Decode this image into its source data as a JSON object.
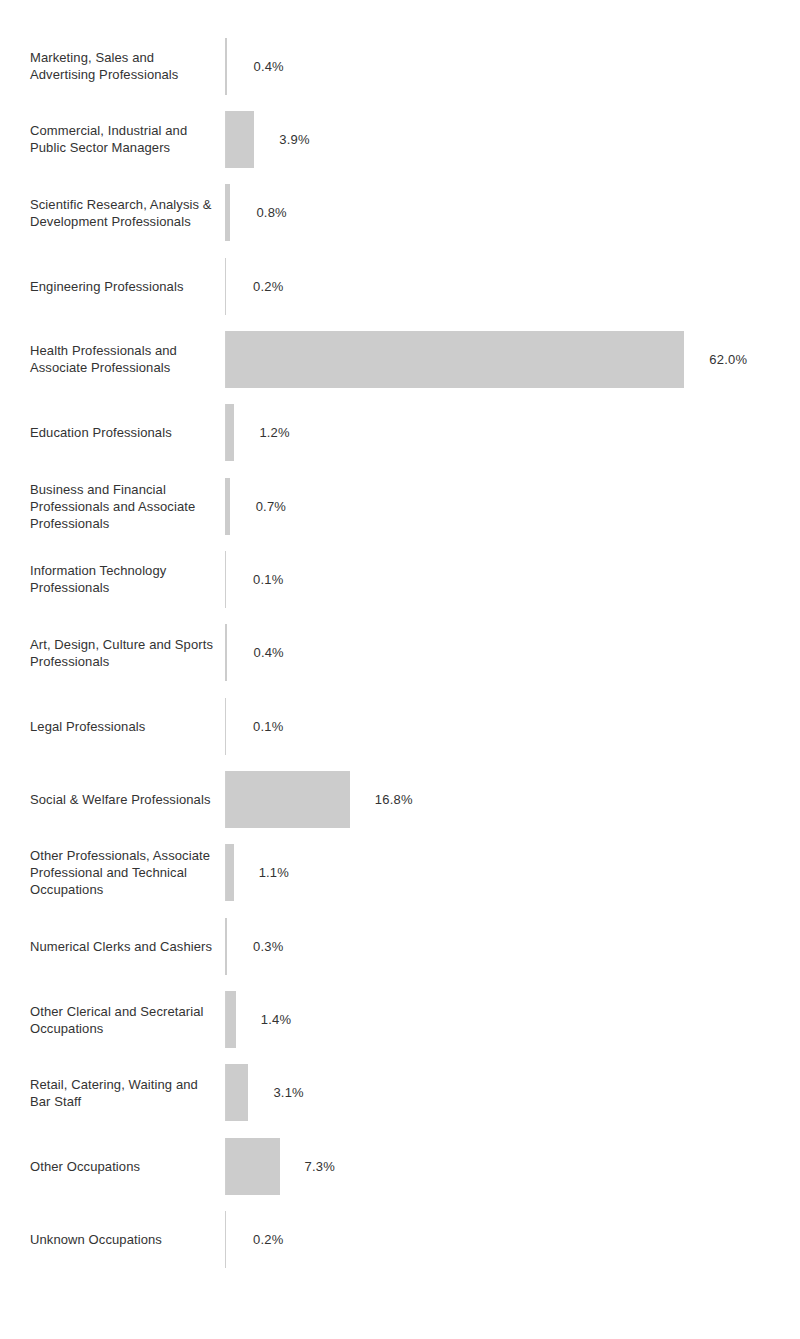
{
  "chart_data": {
    "type": "bar",
    "orientation": "horizontal",
    "title": "",
    "subtitle": "",
    "xlabel": "",
    "ylabel": "",
    "grid": false,
    "legend": null,
    "value_suffix": "%",
    "xlim": [
      0,
      62.0
    ],
    "axis_line": true,
    "bar_color": "#cccccc",
    "text_color": "#333333",
    "axis_color": "#cfcfcf",
    "categories": [
      "Marketing, Sales and Advertising Professionals",
      "Commercial, Industrial and Public Sector Managers",
      "Scientific Research, Analysis & Development Professionals",
      "Engineering Professionals",
      "Health Professionals and Associate Professionals",
      "Education Professionals",
      "Business and Financial Professionals and Associate Professionals",
      "Information Technology Professionals",
      "Art, Design, Culture and Sports Professionals",
      "Legal Professionals",
      "Social & Welfare Professionals",
      "Other Professionals, Associate Professional and Technical Occupations",
      "Numerical Clerks and Cashiers",
      "Other Clerical and Secretarial Occupations",
      "Retail, Catering, Waiting and Bar Staff",
      "Other Occupations",
      "Unknown Occupations"
    ],
    "values": [
      0.4,
      3.9,
      0.8,
      0.2,
      62.0,
      1.2,
      0.7,
      0.1,
      0.4,
      0.1,
      16.8,
      1.1,
      0.3,
      1.4,
      3.1,
      7.3,
      0.2
    ],
    "value_labels": [
      "0.4%",
      "3.9%",
      "0.8%",
      "0.2%",
      "62.0%",
      "1.2%",
      "0.7%",
      "0.1%",
      "0.4%",
      "0.1%",
      "16.8%",
      "1.1%",
      "0.3%",
      "1.4%",
      "3.1%",
      "7.3%",
      "0.2%"
    ]
  },
  "rows": [
    {
      "label": "Marketing, Sales and Advertising Professionals",
      "value": 0.4,
      "value_label": "0.4%"
    },
    {
      "label": "Commercial, Industrial and Public Sector Managers",
      "value": 3.9,
      "value_label": "3.9%"
    },
    {
      "label": "Scientific Research, Analysis & Development Professionals",
      "value": 0.8,
      "value_label": "0.8%"
    },
    {
      "label": "Engineering Professionals",
      "value": 0.2,
      "value_label": "0.2%"
    },
    {
      "label": "Health Professionals and Associate Professionals",
      "value": 62.0,
      "value_label": "62.0%"
    },
    {
      "label": "Education Professionals",
      "value": 1.2,
      "value_label": "1.2%"
    },
    {
      "label": "Business and Financial Professionals and Associate Professionals",
      "value": 0.7,
      "value_label": "0.7%"
    },
    {
      "label": "Information Technology Professionals",
      "value": 0.1,
      "value_label": "0.1%"
    },
    {
      "label": "Art, Design, Culture and Sports Professionals",
      "value": 0.4,
      "value_label": "0.4%"
    },
    {
      "label": "Legal Professionals",
      "value": 0.1,
      "value_label": "0.1%"
    },
    {
      "label": "Social & Welfare Professionals",
      "value": 16.8,
      "value_label": "16.8%"
    },
    {
      "label": "Other Professionals, Associate Professional and Technical Occupations",
      "value": 1.1,
      "value_label": "1.1%"
    },
    {
      "label": "Numerical Clerks and Cashiers",
      "value": 0.3,
      "value_label": "0.3%"
    },
    {
      "label": "Other Clerical and Secretarial Occupations",
      "value": 1.4,
      "value_label": "1.4%"
    },
    {
      "label": "Retail, Catering, Waiting and Bar Staff",
      "value": 3.1,
      "value_label": "3.1%"
    },
    {
      "label": "Other Occupations",
      "value": 7.3,
      "value_label": "7.3%"
    },
    {
      "label": "Unknown Occupations",
      "value": 0.2,
      "value_label": "0.2%"
    }
  ]
}
